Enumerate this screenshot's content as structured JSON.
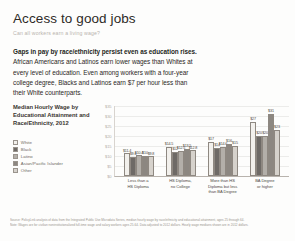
{
  "header": {
    "title": "Access to good jobs",
    "subtitle": "Can all workers earn a living wage?"
  },
  "body": {
    "lead": "Gaps in pay by race/ethnicity persist even as education rises.",
    "lines": [
      "African Americans and Latinos earn lower wages than Whites at",
      "every level of education. Even among workers with a four-year",
      "college degree, Blacks and Latinos earn $7 per hour less than",
      "their White counterparts."
    ]
  },
  "chart_data": {
    "type": "bar",
    "title_lines": [
      "Median Hourly Wage by",
      "Educational Attainment and",
      "Race/Ethnicity, 2012"
    ],
    "title": "Median Hourly Wage by Educational Attainment and Race/Ethnicity, 2012",
    "xlabel": "",
    "ylabel": "",
    "ylim": [
      0,
      35
    ],
    "yticks": [
      "$35",
      "$30",
      "$25",
      "$20",
      "$15",
      "$10",
      "$5",
      "$0"
    ],
    "grid": true,
    "legend_position": "left",
    "categories": [
      "Less than a HS Diploma",
      "HS Diploma, no College",
      "More than HS Diploma but less than BA Degree",
      "BA Degree or higher"
    ],
    "category_label_lines": [
      [
        "Less than a",
        "HS Diploma"
      ],
      [
        "HS Diploma,",
        "no College"
      ],
      [
        "More than HS",
        "Diploma but less",
        "than BA Degree"
      ],
      [
        "BA Degree",
        "or higher"
      ]
    ],
    "series": [
      {
        "name": "White",
        "color": "#f2f0ec",
        "values": [
          11.4,
          14.5,
          17.0,
          27.0
        ],
        "labels": [
          "$11.4",
          "$14.5",
          "$17",
          "$27"
        ]
      },
      {
        "name": "Black",
        "color": "#6e6a66",
        "values": [
          9.6,
          12.0,
          14.0,
          20.0
        ],
        "labels": [
          "$9.6",
          "$12",
          "$14",
          "$20"
        ]
      },
      {
        "name": "Latino",
        "color": "#b3afa9",
        "values": [
          10.4,
          12.5,
          14.6,
          20.0
        ],
        "labels": [
          "$10.4",
          "$12.5",
          "$14.6",
          "$20"
        ]
      },
      {
        "name": "Asian/Pacific Islander",
        "color": "#8c8781",
        "values": [
          10.0,
          13.5,
          16.0,
          31.0
        ],
        "labels": [
          "$10",
          "$13.5",
          "$16",
          "$31"
        ]
      },
      {
        "name": "Other",
        "color": "#d6d2cc",
        "values": [
          9.8,
          12.8,
          15.0,
          23.0
        ],
        "labels": [
          "$9.8",
          "$12.8",
          "$15",
          "$23"
        ]
      }
    ]
  },
  "footer": {
    "lines": [
      "Source: PolicyLink analysis of data from the Integrated Public Use Microdata Series, median hourly wage by race/ethnicity and educational attainment, ages 25 through 64.",
      "Note: Wages are for civilian noninstitutionalized full-time wage and salary workers ages 25-64. Data adjusted to 2012 dollars. Hourly wage medians shown are in 2012 dollars."
    ]
  }
}
